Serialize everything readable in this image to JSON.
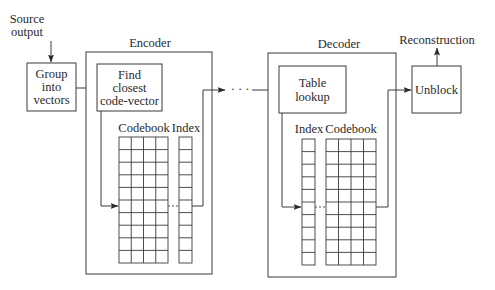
{
  "diagram": {
    "source": {
      "line1": "Source",
      "line2": "output"
    },
    "group_box": {
      "line1": "Group",
      "line2": "into",
      "line3": "vectors"
    },
    "encoder": {
      "label": "Encoder",
      "find_box": {
        "line1": "Find",
        "line2": "closest",
        "line3": "code-vector"
      },
      "codebook_label": "Codebook",
      "index_label": "Index",
      "codebook_cols": 4,
      "rows": 10
    },
    "channel": {
      "ellipsis": "· · ·"
    },
    "decoder": {
      "label": "Decoder",
      "table_box": {
        "line1": "Table",
        "line2": "lookup"
      },
      "index_label": "Index",
      "codebook_label": "Codebook",
      "codebook_cols": 4,
      "rows": 10
    },
    "unblock_box": {
      "label": "Unblock"
    },
    "output": {
      "label": "Reconstruction"
    },
    "colors": {
      "stroke": "#3a3a3a",
      "text": "#2a2a2a",
      "background": "#ffffff"
    }
  }
}
